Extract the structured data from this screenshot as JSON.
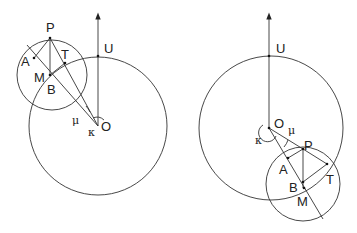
{
  "figures": [
    {
      "name": "left-configuration",
      "labels": {
        "P": "P",
        "A": "A",
        "T": "T",
        "M": "M",
        "B": "B",
        "U": "U",
        "O": "O",
        "mu": "μ",
        "kappa": "κ"
      }
    },
    {
      "name": "right-configuration",
      "labels": {
        "P": "P",
        "A": "A",
        "T": "T",
        "M": "M",
        "B": "B",
        "U": "U",
        "O": "O",
        "mu": "μ",
        "kappa": "κ"
      }
    }
  ],
  "colors": {
    "line": "#333333",
    "background": "#ffffff"
  }
}
